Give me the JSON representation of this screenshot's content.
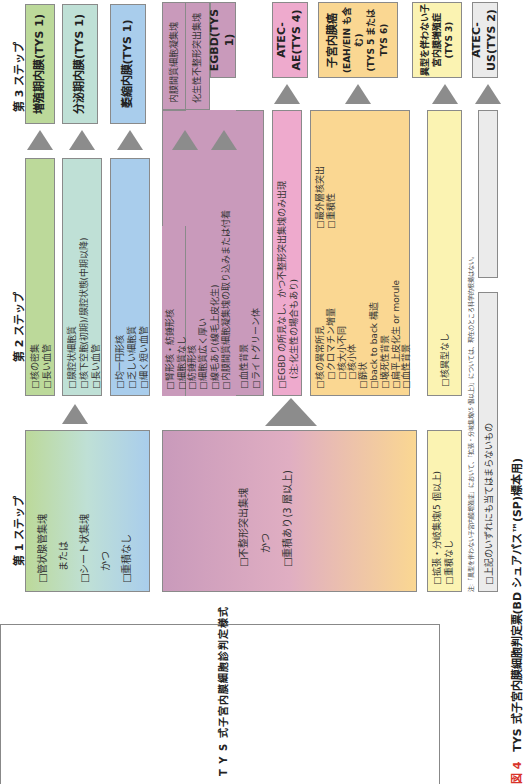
{
  "figure": {
    "number": "図 4",
    "caption": "TYS 式子宮内膜細胞判定票(BD シュアパス™(SP)標本用)",
    "left_title": "T Y S 式子宮内膜細胞診判定様式",
    "note": "注:「異型を伴わない子宮内膜増殖症」において、「拡張・分岐集塊(5 個以上)」については、現在のところ科学的根拠はない。"
  },
  "steps": {
    "step1": "第 1 ステップ",
    "step2": "第 2 ステップ",
    "step3": "第 3 ステップ"
  },
  "step1_boxes": {
    "normal": {
      "lines": [
        "□管状腺管集塊",
        "または",
        "□シート状集塊",
        "かつ",
        "□重積なし"
      ]
    },
    "abnormal": {
      "lines": [
        "□不整形突出集塊",
        "かつ",
        "□重積あり(3 層以上)"
      ]
    },
    "hyperplasia": {
      "lines": [
        "□拡張・分岐集塊(5 個以上)",
        "□重積なし"
      ]
    },
    "none": {
      "lines": [
        "□上記のいずれにも当てはまらないもの"
      ]
    }
  },
  "step2_boxes": {
    "proliferative": [
      "□核の密集",
      "□長い血管"
    ],
    "secretory": [
      "□腺腔状細胞質",
      "□核下空胞(初期)/腺腔状態(中期以降)",
      "□長い血管"
    ],
    "atrophic": [
      "□均一円形核",
      "□乏しい細胞質",
      "□細く短い血管"
    ],
    "egbd_a": [
      "□腎形核・紡錘形核",
      "□細胞質なし"
    ],
    "egbd_b": [
      "□紡錘形核",
      "□細胞質広く厚い",
      "□線毛あり(線毛上皮化生)",
      "□内膜間質細胞凝集塊の取り込みまたは付着"
    ],
    "egbd_c": [
      "□血性背景",
      "□ライトグリーン体"
    ],
    "egbd_top_a": "内膜間質細胞凝集塊",
    "egbd_top_b": "化生性不整形突出集塊",
    "atec_ae": [
      "□EGBD の所見なし、かつ不整形突出集塊のみ出現",
      "(注:化生性の場合もあり)"
    ],
    "malignant_col1": [
      "□核の異常所見",
      "　□クロマチン増量",
      "　□核大小不同",
      "　□核小体",
      "□篩状",
      "□back to back 構造",
      "□壊死性背景",
      "□扁平上皮化生 or morule",
      "□血性背景"
    ],
    "malignant_col2": [
      "□最外層核突出",
      "□重積性"
    ],
    "hyperplasia": [
      "□核異型なし"
    ]
  },
  "step3_results": {
    "proliferative": "増殖期内膜(TYS 1)",
    "secretory": "分泌期内膜(TYS 1)",
    "atrophic": "萎縮内膜(TYS 1)",
    "egbd": "EGBD(TYS 1)",
    "atec_ae": "ATEC-AE(TYS 4)",
    "cancer": [
      "子宮内膜癌",
      "(EAH/EIN も含む)",
      "(TYS 5 または TYS 6)"
    ],
    "hyperplasia": [
      "異型を伴わない子宮内膜増殖症",
      "(TYS 3)"
    ],
    "atec_us": "ATEC-US(TYS 2)"
  },
  "colors": {
    "green": "#bcd99a",
    "teal": "#bfe0d6",
    "blue": "#a9cdec",
    "purple": "#c99abb",
    "pink": "#eeaacd",
    "orange": "#fad792",
    "yellow": "#fbf3b2",
    "gray": "#ebebeb",
    "arrow": "#8c8c8c",
    "caption_red": "#d9342b"
  }
}
